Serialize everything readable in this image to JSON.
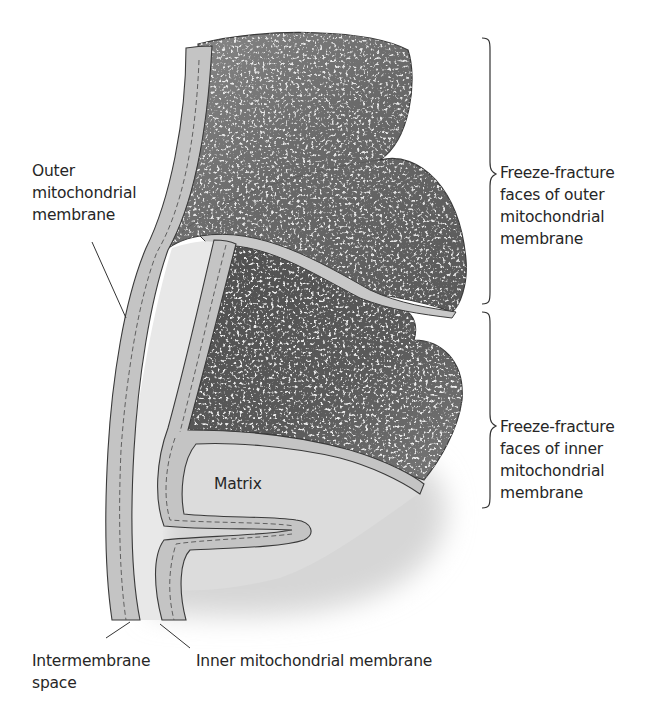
{
  "figure": {
    "type": "labeled scientific illustration",
    "colors": {
      "background": "#ffffff",
      "membrane_fill": "#c4c4c4",
      "membrane_outline": "#3a3a3a",
      "intermembrane_space": "#e6e6e6",
      "matrix": "#dadada",
      "fracture_face_dark": "#555555",
      "fracture_face_light": "#9a9a9a",
      "particle": "#f2f2f2",
      "text": "#262626"
    }
  },
  "labels": {
    "outer_membrane": [
      "Outer",
      "mitochondrial",
      "membrane"
    ],
    "freeze_fracture_outer": [
      "Freeze-fracture",
      "faces of outer",
      "mitochondrial",
      "membrane"
    ],
    "freeze_fracture_inner": [
      "Freeze-fracture",
      "faces of inner",
      "mitochondrial",
      "membrane"
    ],
    "matrix": "Matrix",
    "intermembrane_space": [
      "Intermembrane",
      "space"
    ],
    "inner_membrane": "Inner mitochondrial membrane"
  }
}
